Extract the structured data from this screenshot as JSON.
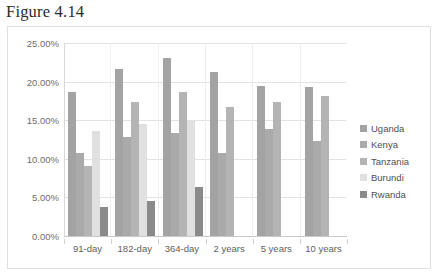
{
  "figure": {
    "title": "Figure 4.14"
  },
  "chart_data": {
    "type": "bar",
    "title": "",
    "subtitle": "",
    "xlabel": "",
    "ylabel": "",
    "grid": true,
    "legend_position": "right",
    "categories": [
      "91-day",
      "182-day",
      "364-day",
      "2 years",
      "5 years",
      "10 years"
    ],
    "ylim": [
      0,
      25
    ],
    "ytick_labels": [
      "0.00%",
      "5.00%",
      "10.00%",
      "15.00%",
      "20.00%",
      "25.00%"
    ],
    "ytick_values": [
      0,
      5,
      10,
      15,
      20,
      25
    ],
    "value_suffix": "%",
    "series": [
      {
        "name": "Uganda",
        "color": "#a3a3a3",
        "values": [
          18.6,
          21.6,
          23.1,
          21.3,
          19.4,
          19.3
        ]
      },
      {
        "name": "Kenya",
        "color": "#aaaaaa",
        "values": [
          10.7,
          12.8,
          13.3,
          10.8,
          13.9,
          12.3
        ]
      },
      {
        "name": "Tanzania",
        "color": "#b4b4b4",
        "values": [
          9.1,
          17.4,
          18.6,
          16.7,
          17.4,
          18.1
        ]
      },
      {
        "name": "Burundi",
        "color": "#e0e0e0",
        "values": [
          13.6,
          14.5,
          14.9,
          null,
          null,
          null
        ]
      },
      {
        "name": "Rwanda",
        "color": "#8a8a8a",
        "values": [
          3.7,
          4.6,
          6.4,
          null,
          null,
          null
        ]
      }
    ]
  },
  "legend": {
    "items": [
      {
        "label": "Uganda"
      },
      {
        "label": "Kenya"
      },
      {
        "label": "Tanzania"
      },
      {
        "label": "Burundi"
      },
      {
        "label": "Rwanda"
      }
    ]
  }
}
